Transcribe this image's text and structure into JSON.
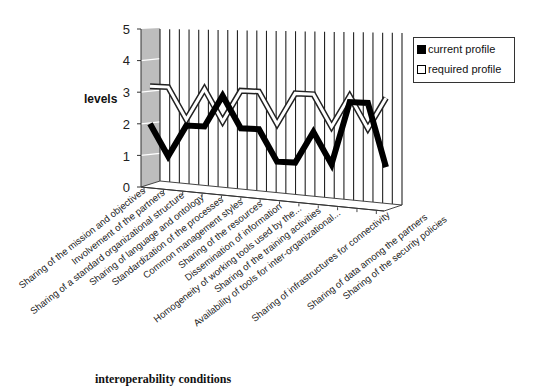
{
  "chart_data": {
    "type": "line",
    "title": "",
    "xlabel": "interoperability conditions",
    "ylabel": "levels",
    "ylim": [
      0,
      5
    ],
    "yticks": [
      0,
      1,
      2,
      3,
      4,
      5
    ],
    "grid": true,
    "style": "3d-line",
    "legend_position": "right",
    "categories": [
      "Sharing of the mission and objectives",
      "Involvement of the partners",
      "Sharing of a standard organizational structure",
      "Sharing of language and ontology",
      "Standardization of the processes",
      "Common management styles",
      "Sharing of the resources",
      "Dissemination of information",
      "Homogeneity of working tools used by the...",
      "Sharing of the training activities",
      "Availability of tools for inter-organizational...",
      "Sharing of infrastructures for connectivity",
      "Sharing of data among the partners",
      "Sharing of the security policies"
    ],
    "series": [
      {
        "name": "current profile",
        "color": "#000000",
        "values": [
          2,
          1,
          2,
          2,
          3,
          2,
          2,
          1,
          1,
          2,
          1,
          3,
          3,
          1
        ]
      },
      {
        "name": "required profile",
        "color": "#ffffff",
        "values": [
          3,
          3,
          2,
          3,
          2,
          3,
          3,
          2,
          3,
          3,
          2,
          3,
          2,
          3
        ]
      }
    ]
  },
  "legend": {
    "current_label": "current profile",
    "required_label": "required profile"
  },
  "axes": {
    "ylabel": "levels",
    "xlabel": "interoperability conditions",
    "ytick_labels": [
      "0",
      "1",
      "2",
      "3",
      "4",
      "5"
    ]
  }
}
